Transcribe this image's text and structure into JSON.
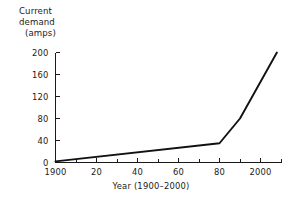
{
  "chart_data": {
    "type": "line",
    "title": "",
    "subtitle": "",
    "ylabel_lines": [
      "Current",
      "demand",
      "(amps)"
    ],
    "ylabel": "Current demand (amps)",
    "xlabel": "Year (1900–2000)",
    "xlim": [
      1900,
      2010
    ],
    "ylim": [
      0,
      200
    ],
    "grid": false,
    "legend": "none",
    "x_tick_labels": [
      "1900",
      "20",
      "40",
      "60",
      "80",
      "2000"
    ],
    "x_tick_values": [
      1900,
      1920,
      1940,
      1960,
      1980,
      2000
    ],
    "x_minor_tick_values": [
      1910,
      1930,
      1950,
      1970,
      1990,
      2010
    ],
    "y_tick_labels": [
      "0",
      "40",
      "80",
      "120",
      "160",
      "200"
    ],
    "y_tick_values": [
      0,
      40,
      80,
      120,
      160,
      200
    ],
    "series": [
      {
        "name": "Current demand",
        "color": "#111111",
        "x": [
          1900,
          1980,
          1990,
          2008
        ],
        "values": [
          2,
          35,
          80,
          200
        ]
      }
    ]
  },
  "axis": {
    "tick_color": "#1a1a1a",
    "line_color": "#1a1a1a"
  }
}
